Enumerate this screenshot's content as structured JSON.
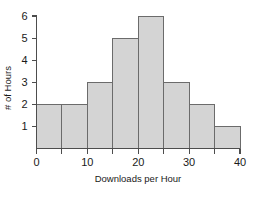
{
  "chart_data": {
    "type": "bar",
    "title": "",
    "subtitle": "",
    "xlabel": "Downloads per Hour",
    "ylabel": "# of Hours",
    "categories": [
      "0-5",
      "5-10",
      "10-15",
      "15-20",
      "20-25",
      "25-30",
      "30-35",
      "35-40"
    ],
    "bin_edges": [
      0,
      5,
      10,
      15,
      20,
      25,
      30,
      35,
      40
    ],
    "values": [
      2,
      2,
      3,
      5,
      6,
      3,
      2,
      1
    ],
    "bin_width": 5,
    "xlim": [
      0,
      40
    ],
    "ylim": [
      0,
      6
    ],
    "x_tick_labels": [
      "0",
      "10",
      "20",
      "30",
      "40"
    ],
    "x_tick_values": [
      0,
      10,
      20,
      30,
      40
    ],
    "x_minor_tick_values": [
      5,
      15,
      25,
      35
    ],
    "y_tick_labels": [
      "1",
      "2",
      "3",
      "4",
      "5",
      "6"
    ],
    "y_tick_values": [
      1,
      2,
      3,
      4,
      5,
      6
    ],
    "grid": false,
    "legend": false,
    "legend_position": "none",
    "annotations": [],
    "colors": {
      "bar_fill": "#d4d4d4",
      "bar_stroke": "#6b6b6b",
      "axis": "#4d4d4d",
      "text": "#1a1a1a",
      "background": "#ffffff"
    }
  },
  "axes": {
    "x_axis_label": "Downloads per Hour",
    "y_axis_label": "# of Hours"
  }
}
